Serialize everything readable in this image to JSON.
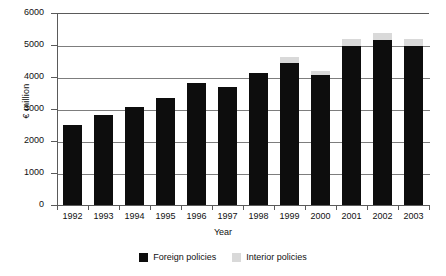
{
  "chart_data": {
    "type": "bar",
    "subtype": "stacked-vertical",
    "title": "",
    "xlabel": "Year",
    "ylabel": "€ million",
    "categories": [
      "1992",
      "1993",
      "1994",
      "1995",
      "1996",
      "1997",
      "1998",
      "1999",
      "2000",
      "2001",
      "2002",
      "2003"
    ],
    "series": [
      {
        "name": "Foreign policies",
        "color": "#0d0d0d",
        "values": [
          2500,
          2800,
          3050,
          3350,
          3800,
          3680,
          4130,
          4450,
          4050,
          4980,
          5150,
          4960
        ]
      },
      {
        "name": "Interior policies",
        "color": "#d9d9d9",
        "values": [
          0,
          0,
          0,
          0,
          0,
          0,
          0,
          180,
          130,
          220,
          240,
          230
        ]
      }
    ],
    "totals": [
      2500,
      2800,
      3050,
      3350,
      3800,
      3680,
      4130,
      4630,
      4180,
      5200,
      5390,
      5190
    ],
    "ylim": [
      0,
      6000
    ],
    "yticks": [
      0,
      1000,
      2000,
      3000,
      4000,
      5000,
      6000
    ],
    "ytick_labels": [
      "0",
      "1000",
      "2000",
      "3000",
      "4000",
      "5000",
      "6000"
    ],
    "grid": "horizontal",
    "legend_position": "bottom-center"
  },
  "legend": {
    "entries": [
      {
        "label": "Foreign policies",
        "color": "#0d0d0d"
      },
      {
        "label": "Interior policies",
        "color": "#d9d9d9"
      }
    ]
  }
}
